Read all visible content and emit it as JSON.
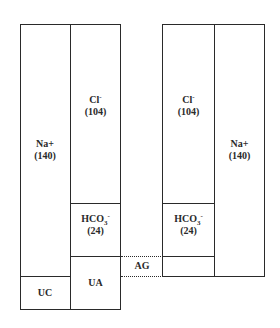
{
  "diagram": {
    "left_column": {
      "cations": {
        "label": "Na+",
        "value": "(140)"
      },
      "unmeasured_cations": {
        "label": "UC"
      },
      "anions_chloride": {
        "label": "Cl",
        "superscript": "-",
        "value": "(104)"
      },
      "anions_bicarbonate": {
        "label": "HCO",
        "subscript": "3",
        "superscript": "-",
        "value": "(24)"
      },
      "unmeasured_anions": {
        "label": "UA"
      }
    },
    "right_column": {
      "anions_chloride": {
        "label": "Cl",
        "superscript": "-",
        "value": "(104)"
      },
      "anions_bicarbonate": {
        "label": "HCO",
        "subscript": "3",
        "superscript": "-",
        "value": "(24)"
      },
      "cations": {
        "label": "Na+",
        "value": "(140)"
      }
    },
    "gap": {
      "label": "AG"
    },
    "colors": {
      "line": "#2a2a2a",
      "background": "#ffffff"
    }
  }
}
